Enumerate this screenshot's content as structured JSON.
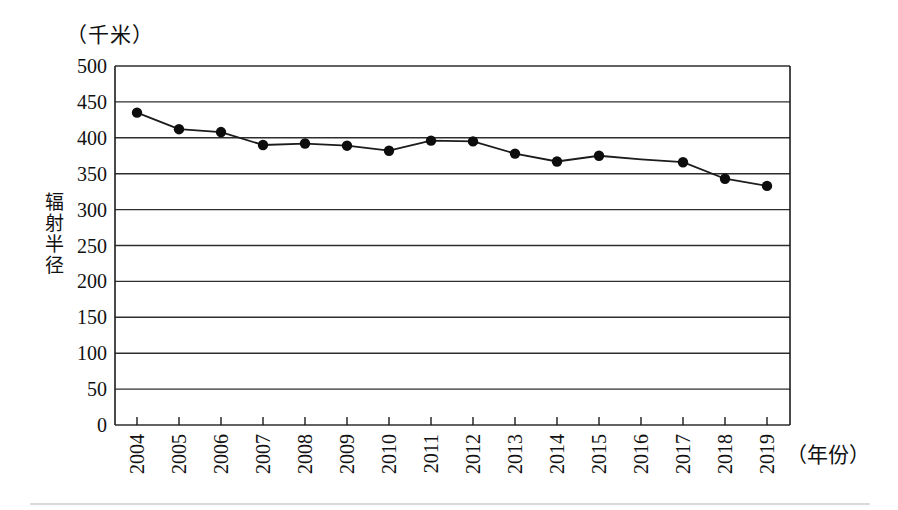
{
  "chart_data": {
    "type": "line",
    "title": "",
    "unit_label": "（千米）",
    "ylabel": "辐射半径",
    "xlabel": "（年份）",
    "categories": [
      "2004",
      "2005",
      "2006",
      "2007",
      "2008",
      "2009",
      "2010",
      "2011",
      "2012",
      "2013",
      "2014",
      "2015",
      "2016",
      "2017",
      "2018",
      "2019"
    ],
    "series": [
      {
        "name": "辐射半径",
        "values": [
          435,
          412,
          408,
          390,
          392,
          389,
          382,
          396,
          395,
          378,
          367,
          375,
          370,
          366,
          343,
          333
        ],
        "markers": [
          true,
          true,
          true,
          true,
          true,
          true,
          true,
          true,
          true,
          true,
          true,
          true,
          false,
          true,
          true,
          true
        ]
      }
    ],
    "ylim": [
      0,
      500
    ],
    "ytick_step": 50,
    "yticks": [
      0,
      50,
      100,
      150,
      200,
      250,
      300,
      350,
      400,
      450,
      500
    ],
    "grid": "horizontal",
    "legend": "none",
    "colors": {
      "line": "#1c1c1c",
      "marker": "#0d0d0d",
      "grid": "#2e2e2e",
      "axis": "#1c1c1c",
      "text": "#111111",
      "background": "#ffffff"
    }
  }
}
